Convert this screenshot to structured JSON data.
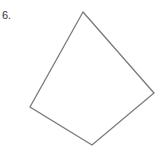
{
  "problem": {
    "number": "6.",
    "shape": "quadrilateral",
    "vertices": [
      [
        83,
        12
      ],
      [
        154,
        93
      ],
      [
        92,
        145
      ],
      [
        30,
        107
      ]
    ],
    "stroke_color": "#7a7a7a"
  }
}
